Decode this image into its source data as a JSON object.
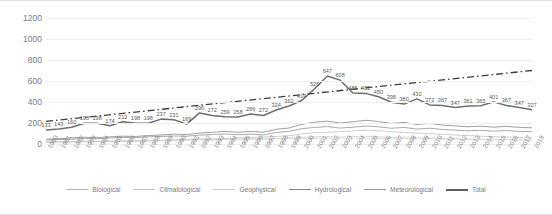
{
  "chart_data": {
    "type": "line",
    "title": "",
    "xlabel": "",
    "ylabel": "",
    "ylim": [
      0,
      1200
    ],
    "yticks": [
      0,
      200,
      400,
      600,
      800,
      1000,
      1200
    ],
    "grid": true,
    "legend_position": "bottom",
    "categories": [
      "1980",
      "1981",
      "1982",
      "1983",
      "1984",
      "1985",
      "1986",
      "1987",
      "1988",
      "1989",
      "1990",
      "1991",
      "1992",
      "1993",
      "1994",
      "1995",
      "1996",
      "1997",
      "1998",
      "1999",
      "2000",
      "2001",
      "2002",
      "2003",
      "2004",
      "2005",
      "2006",
      "2007",
      "2008",
      "2009",
      "2010",
      "2011",
      "2012",
      "2013",
      "2014",
      "2015",
      "2016",
      "2017",
      "2018"
    ],
    "series": [
      {
        "name": "Biological",
        "color": "#b8b8b8",
        "values": [
          18,
          20,
          22,
          26,
          24,
          28,
          26,
          30,
          34,
          32,
          38,
          44,
          48,
          46,
          52,
          58,
          62,
          66,
          72,
          78,
          96,
          108,
          112,
          118,
          124,
          132,
          126,
          118,
          110,
          104,
          98,
          92,
          86,
          80,
          74,
          70,
          66,
          62,
          58
        ]
      },
      {
        "name": "Climatological",
        "color": "#c9c9c9",
        "values": [
          14,
          16,
          18,
          20,
          22,
          24,
          26,
          24,
          28,
          30,
          34,
          36,
          40,
          38,
          44,
          48,
          50,
          46,
          52,
          56,
          64,
          68,
          72,
          66,
          70,
          74,
          68,
          62,
          66,
          60,
          58,
          54,
          50,
          48,
          46,
          44,
          42,
          40,
          38
        ]
      },
      {
        "name": "Geophysical",
        "color": "#d2d2d2",
        "values": [
          22,
          24,
          26,
          28,
          26,
          30,
          32,
          30,
          34,
          36,
          38,
          40,
          42,
          40,
          44,
          46,
          48,
          46,
          50,
          52,
          54,
          56,
          58,
          54,
          56,
          58,
          54,
          50,
          52,
          48,
          50,
          46,
          44,
          42,
          44,
          40,
          42,
          38,
          40
        ]
      },
      {
        "name": "Hydrological",
        "color": "#9a9a9a",
        "values": [
          38,
          42,
          46,
          54,
          50,
          58,
          62,
          60,
          68,
          72,
          76,
          74,
          84,
          90,
          96,
          88,
          94,
          86,
          110,
          120,
          146,
          158,
          166,
          152,
          160,
          172,
          164,
          150,
          158,
          142,
          150,
          138,
          132,
          126,
          130,
          122,
          128,
          120,
          118
        ]
      },
      {
        "name": "Meteorological",
        "color": "#8f8f8f",
        "values": [
          46,
          50,
          58,
          64,
          60,
          68,
          74,
          72,
          80,
          86,
          94,
          90,
          104,
          112,
          120,
          112,
          120,
          112,
          140,
          152,
          188,
          208,
          218,
          200,
          212,
          226,
          214,
          196,
          206,
          186,
          196,
          180,
          172,
          164,
          170,
          160,
          168,
          158,
          154
        ]
      },
      {
        "name": "Total",
        "color": "#6e6e6e",
        "values": [
          133,
          143,
          160,
          198,
          198,
          174,
          212,
          198,
          198,
          237,
          231,
          189,
          296,
          272,
          259,
          258,
          286,
          272,
          324,
          362,
          414,
          526,
          647,
          608,
          485,
          482,
          450,
          398,
          380,
          430,
          372,
          367,
          347,
          361,
          365,
          401,
          367,
          347,
          327
        ],
        "labels": [
          "133",
          "143",
          "160",
          "198",
          "198",
          "174",
          "212",
          "198",
          "198",
          "237",
          "231",
          "189",
          "296",
          "272",
          "259",
          "258",
          "286",
          "272",
          "324",
          "362",
          "414",
          "526",
          "647",
          "608",
          "485",
          "482",
          "450",
          "398",
          "380",
          "430",
          "372",
          "367",
          "347",
          "361",
          "365",
          "401",
          "367",
          "347",
          "327"
        ]
      }
    ],
    "trendline": {
      "name": "trend",
      "color": "#3d3d3d",
      "style": "dash-dot",
      "start": 215,
      "end": 700
    }
  },
  "legend": {
    "items": [
      {
        "label": "Biological",
        "color": "#b8b8b8",
        "width": "1.1px"
      },
      {
        "label": "Climatological",
        "color": "#c4c4c4",
        "width": "1.1px"
      },
      {
        "label": "Geophysical",
        "color": "#cfcfcf",
        "width": "1.1px"
      },
      {
        "label": "Hydrological",
        "color": "#8a8a8a",
        "width": "1.6px"
      },
      {
        "label": "Meteorological",
        "color": "#9f9f9f",
        "width": "1.1px"
      },
      {
        "label": "Total",
        "color": "#5f5f5f",
        "width": "2.1px"
      }
    ]
  }
}
